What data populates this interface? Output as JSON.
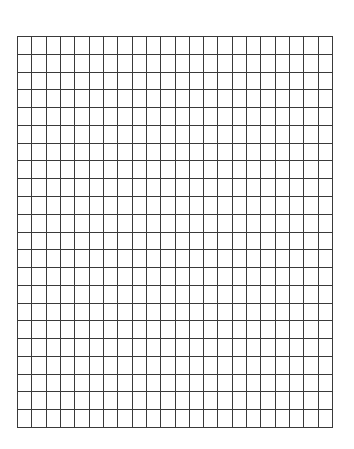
{
  "grid": {
    "columns": 22,
    "rows": 22,
    "line_color": "#3a3a3a",
    "background_color": "#ffffff"
  }
}
